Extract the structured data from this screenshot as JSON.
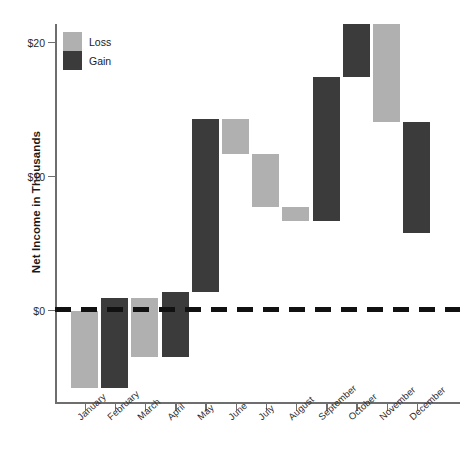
{
  "chart_data": {
    "type": "bar",
    "title": "",
    "subtitle": "",
    "xlabel": "",
    "ylabel": "Net Income in Thousands",
    "categories": [
      "January",
      "February",
      "March",
      "April",
      "May",
      "June",
      "July",
      "August",
      "September",
      "October",
      "November",
      "December"
    ],
    "ylim": [
      -6.5,
      21.5
    ],
    "yticks": [
      0,
      10,
      20
    ],
    "ytick_labels": [
      "$0",
      "$10",
      "$20"
    ],
    "grid": false,
    "legend_position": "top-left",
    "waterfall": true,
    "series": [
      {
        "name": "Net change",
        "values": [
          -5.8,
          6.7,
          -4.4,
          4.9,
          12.9,
          -2.6,
          -4.0,
          -1.0,
          10.7,
          4.0,
          -7.3,
          -8.3
        ]
      },
      {
        "name": "Cumulative net income",
        "values": [
          -5.8,
          0.9,
          -3.5,
          1.4,
          14.3,
          11.7,
          7.7,
          6.7,
          17.4,
          21.4,
          14.1,
          5.8
        ]
      }
    ],
    "bars": [
      {
        "category": "January",
        "type": "Loss",
        "start": 0.0,
        "end": -5.8
      },
      {
        "category": "February",
        "type": "Gain",
        "start": -5.8,
        "end": 0.9
      },
      {
        "category": "March",
        "type": "Loss",
        "start": 0.9,
        "end": -3.5
      },
      {
        "category": "April",
        "type": "Gain",
        "start": -3.5,
        "end": 1.4
      },
      {
        "category": "May",
        "type": "Gain",
        "start": 1.4,
        "end": 14.3
      },
      {
        "category": "June",
        "type": "Loss",
        "start": 14.3,
        "end": 11.7
      },
      {
        "category": "July",
        "type": "Loss",
        "start": 11.7,
        "end": 7.7
      },
      {
        "category": "August",
        "type": "Loss",
        "start": 7.7,
        "end": 6.7
      },
      {
        "category": "September",
        "type": "Gain",
        "start": 6.7,
        "end": 17.4
      },
      {
        "category": "October",
        "type": "Gain",
        "start": 17.4,
        "end": 21.4
      },
      {
        "category": "November",
        "type": "Loss",
        "start": 21.4,
        "end": 14.1
      },
      {
        "category": "December",
        "type": "Gain",
        "start": 14.1,
        "end": 5.8
      }
    ],
    "legend": [
      {
        "label": "Loss",
        "color": "#b0b0b0"
      },
      {
        "label": "Gain",
        "color": "#3b3b3b"
      }
    ],
    "colors": {
      "loss": "#b0b0b0",
      "gain": "#3b3b3b",
      "axis": "#6e6e6e",
      "zero_line": "#111111",
      "text": "#1a1a1a",
      "background": "#ffffff"
    },
    "zero_reference_line": {
      "value": 0,
      "style": "dashed"
    }
  }
}
